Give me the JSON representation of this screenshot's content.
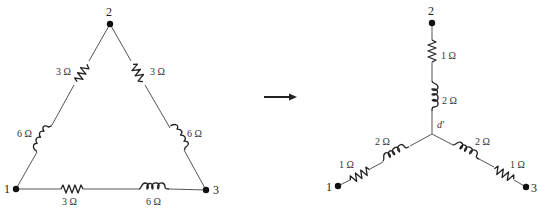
{
  "delta": {
    "nodes": [
      {
        "id": "1",
        "label": "1"
      },
      {
        "id": "2",
        "label": "2"
      },
      {
        "id": "3",
        "label": "3"
      }
    ],
    "branches": {
      "side_12": {
        "resistor": "3 Ω",
        "inductor": "6 Ω"
      },
      "side_23": {
        "resistor": "3 Ω",
        "inductor": "6 Ω"
      },
      "side_13": {
        "resistor": "3 Ω",
        "inductor": "6 Ω"
      }
    }
  },
  "arrow": {
    "direction": "right"
  },
  "wye": {
    "nodes": [
      {
        "id": "1",
        "label": "1"
      },
      {
        "id": "2",
        "label": "2"
      },
      {
        "id": "3",
        "label": "3"
      }
    ],
    "center_label": "d'",
    "branches": {
      "arm_2": {
        "resistor": "1 Ω",
        "inductor": "2 Ω"
      },
      "arm_1": {
        "resistor": "1 Ω",
        "inductor": "2 Ω"
      },
      "arm_3": {
        "resistor": "1 Ω",
        "inductor": "2 Ω"
      }
    }
  }
}
